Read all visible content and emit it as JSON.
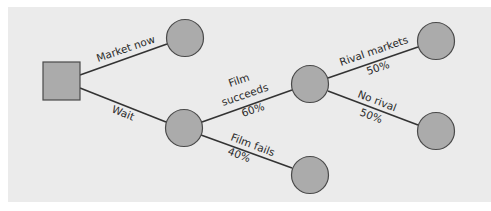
{
  "diagram": {
    "colors": {
      "background": "#ebebeb",
      "node_fill": "#ababab",
      "node_stroke": "#4a4a4a",
      "line": "#333333"
    },
    "nodes": {
      "decision": {
        "type": "decision-square"
      },
      "market_now_outcome": {
        "type": "chance-circle"
      },
      "wait_chance": {
        "type": "chance-circle"
      },
      "film_succeeds_chance": {
        "type": "chance-circle"
      },
      "rival_markets_outcome": {
        "type": "chance-circle"
      },
      "no_rival_outcome": {
        "type": "chance-circle"
      },
      "film_fails_outcome": {
        "type": "chance-circle"
      }
    },
    "branches": {
      "market_now": {
        "label": "Market now"
      },
      "wait": {
        "label": "Wait"
      },
      "film_succeeds": {
        "label_line1": "Film",
        "label_line2": "succeeds",
        "probability": "60%"
      },
      "film_fails": {
        "label": "Film fails",
        "probability": "40%"
      },
      "rival_markets": {
        "label": "Rival markets",
        "probability": "50%"
      },
      "no_rival": {
        "label": "No rival",
        "probability": "50%"
      }
    }
  }
}
